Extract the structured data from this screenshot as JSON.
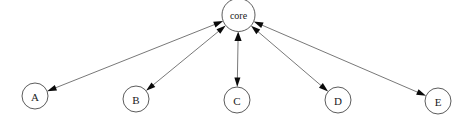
{
  "diagram": {
    "title": "core",
    "type": "star-topology",
    "background_color": "#ffffff",
    "node_fill_color": "#ffffff",
    "node_stroke_color": "#4a4a4a",
    "edge_color": "#555555",
    "arrow_color": "#0a0a0a",
    "hub": {
      "id": "core",
      "label": "core",
      "cx": 238.5,
      "cy": 15,
      "r": 16.5
    },
    "nodes": [
      {
        "id": "A",
        "label": "A",
        "cx": 35,
        "cy": 96,
        "r": 13
      },
      {
        "id": "B",
        "label": "B",
        "cx": 136,
        "cy": 99,
        "r": 13
      },
      {
        "id": "C",
        "label": "C",
        "cx": 237,
        "cy": 100,
        "r": 13
      },
      {
        "id": "D",
        "label": "D",
        "cx": 338,
        "cy": 100,
        "r": 13
      },
      {
        "id": "E",
        "label": "E",
        "cx": 438,
        "cy": 101,
        "r": 13
      }
    ],
    "edges": [
      {
        "from": "core",
        "to": "A",
        "bidirectional": true
      },
      {
        "from": "core",
        "to": "B",
        "bidirectional": true
      },
      {
        "from": "core",
        "to": "C",
        "bidirectional": true
      },
      {
        "from": "core",
        "to": "D",
        "bidirectional": true
      },
      {
        "from": "core",
        "to": "E",
        "bidirectional": true
      }
    ]
  }
}
